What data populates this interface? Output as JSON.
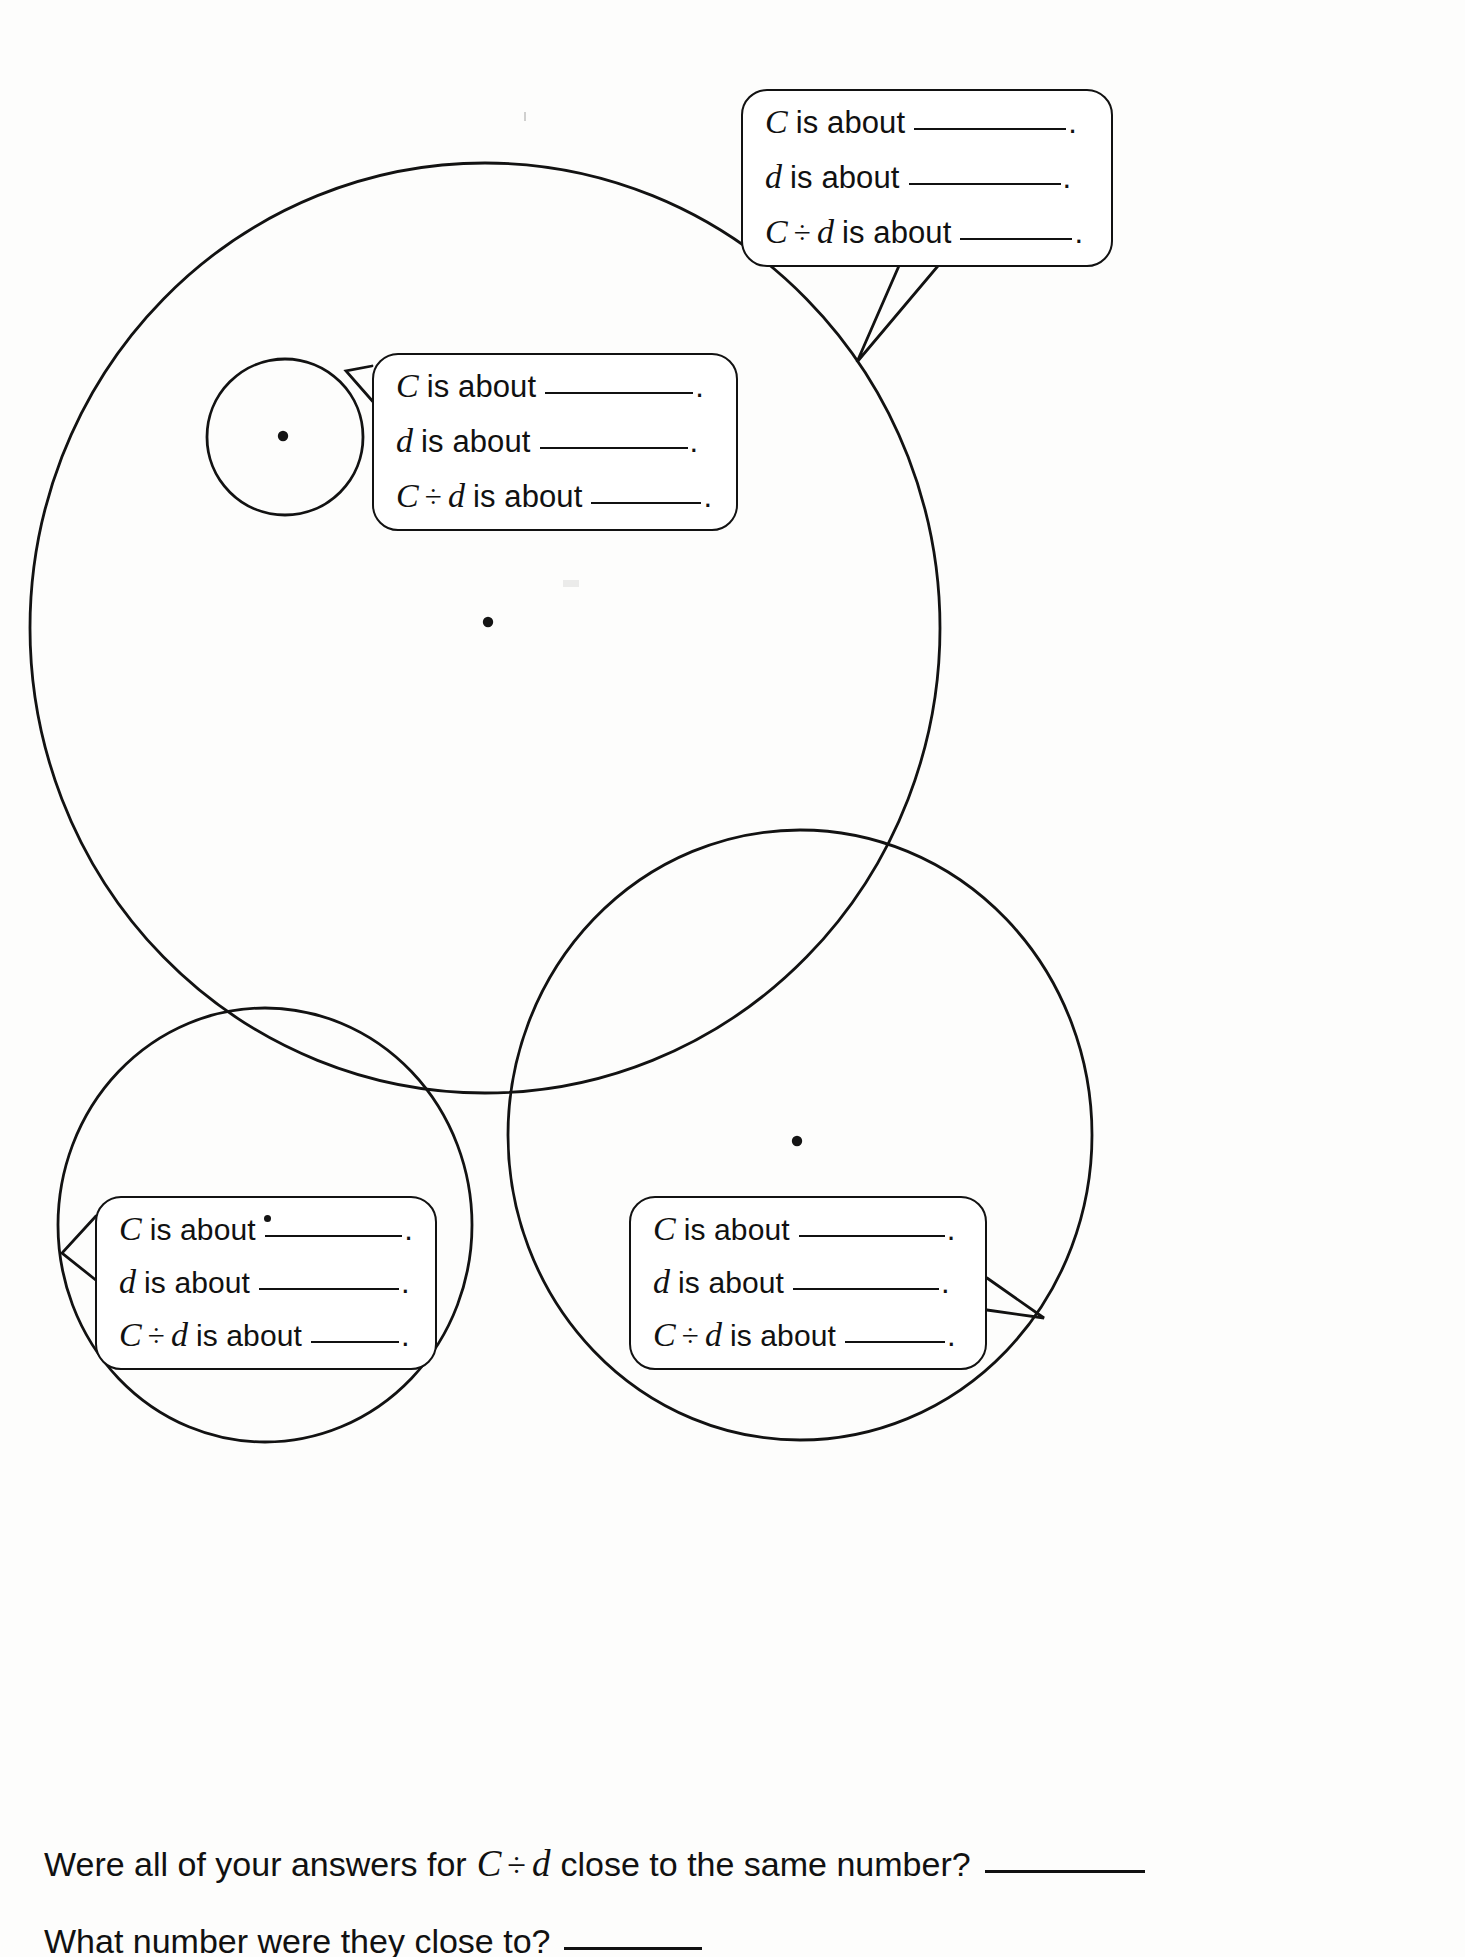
{
  "page": {
    "background": "#fdfdfc",
    "ink": "#111111",
    "width": 1465,
    "height": 1957
  },
  "labels": {
    "c_var": "C",
    "d_var": "d",
    "divide_symbol": "÷",
    "is_about": "is about",
    "period": "."
  },
  "callouts": [
    {
      "id": "top-right",
      "anchor_circle": "large-circle",
      "lines": [
        {
          "var": "C",
          "text": "is about",
          "blank": "________",
          "end": "."
        },
        {
          "var": "d",
          "text": "is about",
          "blank": "________",
          "end": "."
        },
        {
          "var": "C ÷ d",
          "text": "is about",
          "blank": "______",
          "end": "."
        }
      ]
    },
    {
      "id": "middle",
      "anchor_circle": "small-circle",
      "lines": [
        {
          "var": "C",
          "text": "is about",
          "blank": "________",
          "end": "."
        },
        {
          "var": "d",
          "text": "is about",
          "blank": "________",
          "end": "."
        },
        {
          "var": "C ÷ d",
          "text": "is about",
          "blank": "______",
          "end": "."
        }
      ]
    },
    {
      "id": "bottom-left",
      "anchor_circle": "bottom-left-circle",
      "lines": [
        {
          "var": "C",
          "text": "is about",
          "blank": "________",
          "end": "."
        },
        {
          "var": "d",
          "text": "is about",
          "blank": "________",
          "end": "."
        },
        {
          "var": "C ÷ d",
          "text": "is about",
          "blank": "_____",
          "end": "."
        }
      ]
    },
    {
      "id": "bottom-right",
      "anchor_circle": "bottom-right-circle",
      "lines": [
        {
          "var": "C",
          "text": "is about",
          "blank": "________",
          "end": "."
        },
        {
          "var": "d",
          "text": "is about",
          "blank": "________",
          "end": "."
        },
        {
          "var": "C ÷ d",
          "text": "is about",
          "blank": "______",
          "end": "."
        }
      ]
    }
  ],
  "questions": [
    {
      "id": "q1",
      "before": "Were all of your answers for",
      "var": "C ÷ d",
      "after": "close to the same number?",
      "blank": "________"
    },
    {
      "id": "q2",
      "before": "What number were they close to?",
      "var": "",
      "after": "",
      "blank": "_______"
    }
  ],
  "circles": [
    {
      "id": "large-circle",
      "cx": 485,
      "cy": 628,
      "rx": 455,
      "ry": 465,
      "dot": true
    },
    {
      "id": "small-circle",
      "cx": 285,
      "cy": 437,
      "rx": 78,
      "ry": 78,
      "dot": true
    },
    {
      "id": "bottom-left-circle",
      "cx": 265,
      "cy": 1225,
      "rx": 207,
      "ry": 217,
      "dot": true
    },
    {
      "id": "bottom-right-circle",
      "cx": 800,
      "cy": 1135,
      "rx": 292,
      "ry": 305,
      "dot": true
    }
  ]
}
